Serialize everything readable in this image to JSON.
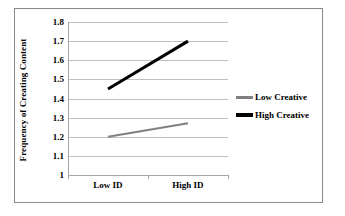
{
  "chart_data": {
    "type": "line",
    "title": "",
    "xlabel": "",
    "ylabel": "Frequency of Creating Content",
    "categories": [
      "Low ID",
      "High ID"
    ],
    "series": [
      {
        "name": "Low Creative",
        "values": [
          1.2,
          1.27
        ],
        "color": "#808080",
        "width": 2
      },
      {
        "name": "High Creative",
        "values": [
          1.45,
          1.7
        ],
        "color": "#000000",
        "width": 3
      }
    ],
    "ylim": [
      1.0,
      1.8
    ],
    "ytick_labels": [
      "1.8",
      "1.7",
      "1.6",
      "1.5",
      "1.4",
      "1.3",
      "1.2",
      "1.1",
      "1"
    ],
    "ytick_values": [
      1.8,
      1.7,
      1.6,
      1.5,
      1.4,
      1.3,
      1.2,
      1.1,
      1.0
    ],
    "grid": true,
    "grid_color": "#bfbfbf",
    "legend_position": "right",
    "frame": true,
    "frame_color": "#8a8a8a",
    "background": "#ffffff"
  },
  "legend": {
    "entries": [
      {
        "label": "Low Creative"
      },
      {
        "label": "High Creative"
      }
    ]
  },
  "axis": {
    "y_title": "Frequency of Creating Content",
    "x_categories": [
      "Low ID",
      "High ID"
    ]
  }
}
